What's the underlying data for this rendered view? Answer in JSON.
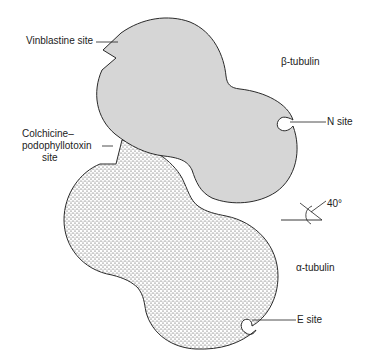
{
  "diagram": {
    "subunits": [
      {
        "id": "beta",
        "label": "β-tubulin",
        "fill": "#d6d6d6",
        "pattern": "light-grey"
      },
      {
        "id": "alpha",
        "label": "α-tubulin",
        "fill": "#ffffff",
        "pattern": "stipple"
      }
    ],
    "sites": [
      {
        "id": "vinblastine",
        "label": "Vinblastine site"
      },
      {
        "id": "colchicine",
        "label_lines": [
          "Colchicine–",
          "podophyllotoxin",
          "site"
        ]
      },
      {
        "id": "n-site",
        "label": "N site"
      },
      {
        "id": "e-site",
        "label": "E site"
      }
    ],
    "angle": {
      "label": "40°"
    },
    "colors": {
      "outline": "#2a2a2a",
      "beta_fill": "#d6d6d6",
      "alpha_dot": "#333333",
      "text": "#222222"
    }
  }
}
